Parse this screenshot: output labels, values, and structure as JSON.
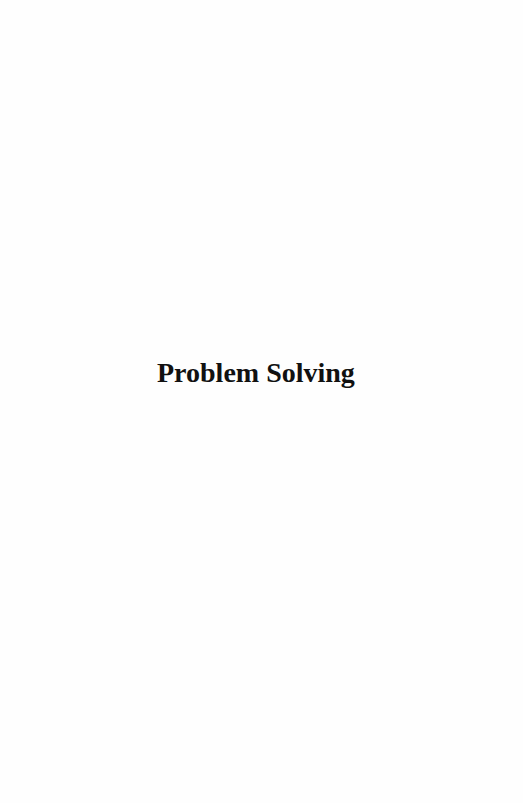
{
  "page": {
    "title": "Problem Solving"
  }
}
